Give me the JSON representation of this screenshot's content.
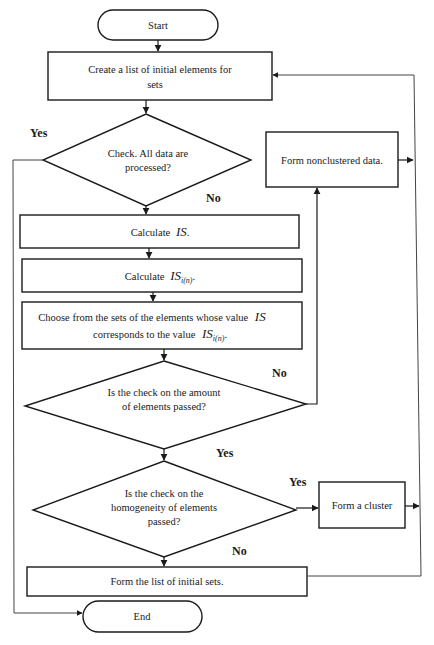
{
  "flowchart": {
    "start": {
      "label": "Start"
    },
    "create_list": {
      "line1": "Create a list of initial elements for",
      "line2": "sets"
    },
    "decision_processed": {
      "line1": "Check. All data are",
      "line2": "processed?",
      "yes": "Yes",
      "no": "No"
    },
    "form_nonclustered": {
      "label": "Form nonclustered data."
    },
    "calc_is": {
      "prefix": "Calculate",
      "symbol": "IS",
      "suffix": "."
    },
    "calc_is_in": {
      "prefix": "Calculate",
      "symbol": "IS",
      "subscript": "i(n)",
      "suffix": "."
    },
    "choose": {
      "line1_prefix": "Choose from the sets of the elements whose value",
      "line1_symbol": "IS",
      "line2_prefix": "corresponds to the value",
      "line2_symbol": "IS",
      "line2_subscript": "i(n)",
      "line2_suffix": "."
    },
    "decision_amount": {
      "line1": "Is the check on the amount",
      "line2": "of elements passed?",
      "no": "No",
      "yes": "Yes"
    },
    "decision_homogeneity": {
      "line1": "Is the check on the",
      "line2": "homogeneity of elements",
      "line3": "passed?",
      "yes": "Yes",
      "no": "No"
    },
    "form_cluster": {
      "label": "Form a cluster"
    },
    "form_list": {
      "label": "Form the list of initial sets."
    },
    "end": {
      "label": "End"
    }
  }
}
